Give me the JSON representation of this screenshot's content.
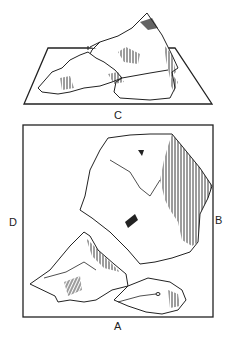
{
  "figure": {
    "top_view_label": "C",
    "plan_labels": {
      "left": "D",
      "right": "B",
      "bottom": "A"
    }
  },
  "colors": {
    "ink": "#222222",
    "background": "#ffffff"
  }
}
